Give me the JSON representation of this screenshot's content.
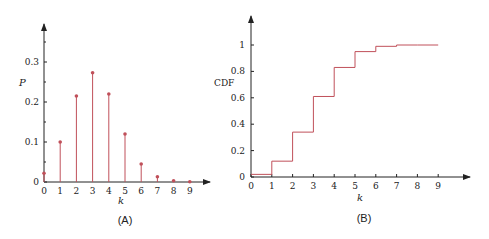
{
  "chart_data": [
    {
      "id": "A",
      "type": "stem",
      "caption": "(A)",
      "xlabel": "k",
      "ylabel": "P",
      "x": [
        0,
        1,
        2,
        3,
        4,
        5,
        6,
        7,
        8,
        9
      ],
      "values": [
        0.022,
        0.1,
        0.215,
        0.273,
        0.22,
        0.12,
        0.045,
        0.013,
        0.003,
        0.0005
      ],
      "x_ticks": [
        "0",
        "1",
        "2",
        "3",
        "4",
        "5",
        "6",
        "7",
        "8",
        "9"
      ],
      "y_ticks": [
        "0",
        "0.1",
        "0.2",
        "0.3"
      ],
      "ylim": [
        0,
        0.38
      ],
      "grid": false,
      "color": "#c0505a"
    },
    {
      "id": "B",
      "type": "step",
      "caption": "(B)",
      "xlabel": "k",
      "ylabel": "CDF",
      "x": [
        0,
        1,
        2,
        3,
        4,
        5,
        6,
        7,
        8,
        9
      ],
      "values": [
        0.02,
        0.12,
        0.34,
        0.61,
        0.83,
        0.95,
        0.99,
        1.0,
        1.0,
        1.0
      ],
      "x_ticks": [
        "0",
        "1",
        "2",
        "3",
        "4",
        "5",
        "6",
        "7",
        "8",
        "9"
      ],
      "y_ticks": [
        "0",
        "0.2",
        "0.4",
        "0.6",
        "0.8",
        "1"
      ],
      "ylim": [
        0,
        1.15
      ],
      "grid": false,
      "color": "#c0505a"
    }
  ]
}
